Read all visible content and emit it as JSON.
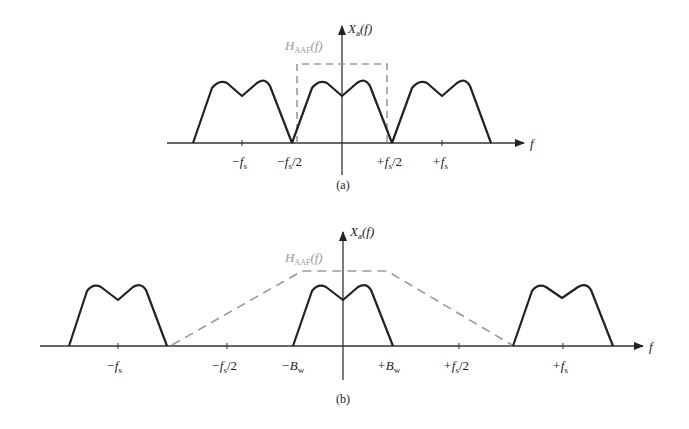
{
  "colors": {
    "spectrum": "#222222",
    "axis": "#333333",
    "filter": "#9a9a9a",
    "background": "#ffffff"
  },
  "panel_a": {
    "caption": "(a)",
    "y_axis_label": "X",
    "y_axis_sub": "a",
    "y_axis_arg": "(f)",
    "x_axis_label": "f",
    "filter_label": "H",
    "filter_sub": "AAF",
    "filter_arg": "(f)",
    "ticks": [
      "−f",
      "−f",
      "+f",
      "+f"
    ],
    "tick_labels": {
      "neg_fs": "−f",
      "neg_fs_sub": "s",
      "neg_half_fs": "−f",
      "neg_half_fs_sub": "s",
      "neg_half_fs_tail": "/2",
      "pos_half_fs": "+f",
      "pos_half_fs_sub": "s",
      "pos_half_fs_tail": "/2",
      "pos_fs": "+f",
      "pos_fs_sub": "s"
    }
  },
  "panel_b": {
    "caption": "(b)",
    "y_axis_label": "X",
    "y_axis_sub": "a",
    "y_axis_arg": "(f)",
    "x_axis_label": "f",
    "filter_label": "H",
    "filter_sub": "AAF",
    "filter_arg": "(f)",
    "tick_labels": {
      "neg_fs": "−f",
      "neg_fs_sub": "s",
      "neg_half_fs": "−f",
      "neg_half_fs_sub": "s",
      "neg_half_fs_tail": "/2",
      "neg_bw": "−B",
      "neg_bw_sub": "w",
      "pos_bw": "+B",
      "pos_bw_sub": "w",
      "pos_half_fs": "+f",
      "pos_half_fs_sub": "s",
      "pos_half_fs_tail": "/2",
      "pos_fs": "+f",
      "pos_fs_sub": "s"
    }
  }
}
